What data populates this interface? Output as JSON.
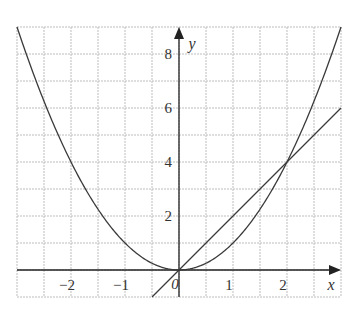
{
  "chart_data": {
    "type": "line",
    "title": "",
    "xlabel": "x",
    "ylabel": "y",
    "xlim": [
      -3,
      3
    ],
    "ylim": [
      -1,
      9
    ],
    "grid": true,
    "grid_x_step": 0.5,
    "grid_y_step": 1,
    "x_ticks": [
      -2,
      -1,
      0,
      1,
      2
    ],
    "x_tick_labels": [
      "−2",
      "−1",
      "0",
      "1",
      "2"
    ],
    "y_ticks": [
      2,
      4,
      6,
      8
    ],
    "y_tick_labels": [
      "2",
      "4",
      "6",
      "8"
    ],
    "origin_label": "0",
    "series": [
      {
        "name": "y = x^2",
        "kind": "parabola",
        "x": [
          -3,
          -2.5,
          -2,
          -1.5,
          -1,
          -0.5,
          0,
          0.5,
          1,
          1.5,
          2,
          2.5,
          3
        ],
        "y": [
          9,
          6.25,
          4,
          2.25,
          1,
          0.25,
          0,
          0.25,
          1,
          2.25,
          4,
          6.25,
          9
        ]
      },
      {
        "name": "y = 2x",
        "kind": "line",
        "x": [
          -0.5,
          3
        ],
        "y": [
          -1,
          6
        ]
      }
    ],
    "intersections": [
      [
        0,
        0
      ],
      [
        2,
        4
      ]
    ],
    "colors": {
      "curve": "#3a3a3a",
      "grid": "#bdbdbd",
      "axis": "#222222",
      "text": "#333333"
    }
  }
}
